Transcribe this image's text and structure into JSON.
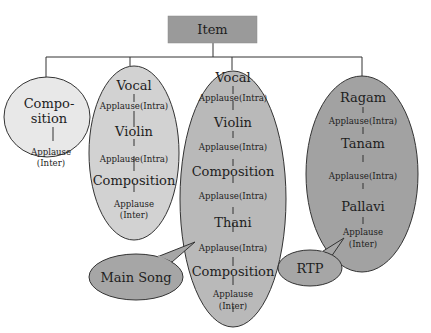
{
  "root": {
    "label": "Item",
    "fill": "#9a9a9a"
  },
  "groups": [
    {
      "id": "composition-only",
      "fill": "#e8e8e8",
      "lines": [
        "Compo-",
        "sition",
        "Applause",
        "(Inter)"
      ]
    },
    {
      "id": "vocal-violin-composition",
      "fill": "#d2d2d2",
      "items": [
        "Vocal",
        "Applause(Intra)",
        "Violin",
        "Applause(Intra)",
        "Composition",
        "Applause",
        "(Inter)"
      ]
    },
    {
      "id": "main-song",
      "fill": "#b9b9b9",
      "items": [
        "Vocal",
        "Applause(Intra)",
        "Violin",
        "Applause(Intra)",
        "Composition",
        "Applause(Intra)",
        "Thani",
        "Applause(Intra)",
        "Composition",
        "Applause",
        "(Inter)"
      ]
    },
    {
      "id": "rtp",
      "fill": "#a2a2a2",
      "items": [
        "Ragam",
        "Applause(Intra)",
        "Tanam",
        "Applause(Intra)",
        "Pallavi",
        "Applause",
        "(Inter)"
      ]
    }
  ],
  "callouts": [
    {
      "label": "Main Song",
      "fill": "#a6a6a6"
    },
    {
      "label": "RTP",
      "fill": "#a6a6a6"
    }
  ]
}
